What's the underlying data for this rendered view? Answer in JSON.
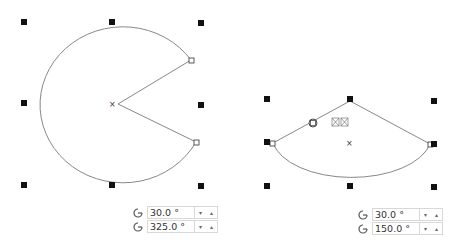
{
  "left_shape": {
    "start_angle": "30.0 °",
    "end_angle": "325.0 °"
  },
  "right_shape": {
    "start_angle": "30.0 °",
    "end_angle": "150.0 °"
  },
  "spinner": {
    "down": "▾",
    "up": "▴"
  }
}
